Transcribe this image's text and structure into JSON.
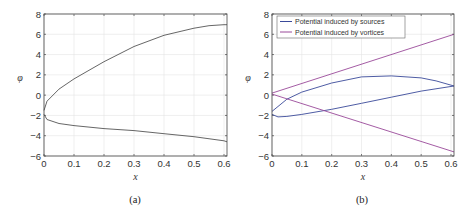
{
  "chart_data": [
    {
      "panel": "(a)",
      "type": "line",
      "xlabel": "x",
      "ylabel": "φ",
      "xlim": [
        0,
        0.61
      ],
      "ylim": [
        -6,
        8
      ],
      "xticks": [
        "0",
        "0.1",
        "0.2",
        "0.3",
        "0.4",
        "0.5",
        "0.6"
      ],
      "yticks": [
        "-6",
        "-4",
        "-2",
        "0",
        "2",
        "4",
        "6",
        "8"
      ],
      "grid": true,
      "series": [
        {
          "name": "upper",
          "x": [
            0,
            0.01,
            0.05,
            0.1,
            0.2,
            0.3,
            0.4,
            0.5,
            0.55,
            0.6,
            0.61
          ],
          "y": [
            -1.5,
            -0.6,
            0.6,
            1.6,
            3.3,
            4.8,
            5.9,
            6.6,
            6.85,
            6.95,
            6.95
          ]
        },
        {
          "name": "lower",
          "x": [
            0,
            0.01,
            0.05,
            0.1,
            0.2,
            0.3,
            0.4,
            0.5,
            0.6,
            0.61
          ],
          "y": [
            -1.9,
            -2.4,
            -2.8,
            -3.0,
            -3.3,
            -3.5,
            -3.8,
            -4.1,
            -4.5,
            -4.6
          ]
        }
      ]
    },
    {
      "panel": "(b)",
      "type": "line",
      "xlabel": "x",
      "ylabel": "φ",
      "xlim": [
        0,
        0.61
      ],
      "ylim": [
        -6,
        8
      ],
      "xticks": [
        "0",
        "0.1",
        "0.2",
        "0.3",
        "0.4",
        "0.5",
        "0.6"
      ],
      "yticks": [
        "-6",
        "-4",
        "-2",
        "0",
        "2",
        "4",
        "6",
        "8"
      ],
      "grid": true,
      "legend": [
        "Potential induced by sources",
        "Potential induced by vortices"
      ],
      "legend_position": "upper left",
      "series": [
        {
          "name": "Potential induced by sources (upper)",
          "x": [
            0,
            0.05,
            0.1,
            0.2,
            0.3,
            0.4,
            0.5,
            0.55,
            0.61
          ],
          "y": [
            -1.6,
            -0.4,
            0.3,
            1.2,
            1.8,
            1.9,
            1.7,
            1.4,
            0.9
          ]
        },
        {
          "name": "Potential induced by sources (lower)",
          "x": [
            0,
            0.02,
            0.05,
            0.1,
            0.2,
            0.3,
            0.4,
            0.5,
            0.61
          ],
          "y": [
            -1.9,
            -2.15,
            -2.1,
            -1.9,
            -1.4,
            -0.8,
            -0.2,
            0.4,
            0.9
          ]
        },
        {
          "name": "Potential induced by vortices (upper)",
          "x": [
            0,
            0.61
          ],
          "y": [
            0.2,
            6.0
          ]
        },
        {
          "name": "Potential induced by vortices (lower)",
          "x": [
            0,
            0.61
          ],
          "y": [
            0.1,
            -5.6
          ]
        }
      ]
    }
  ],
  "panels": {
    "a": {
      "caption": "(a)",
      "xlabel": "x",
      "ylabel": "φ"
    },
    "b": {
      "caption": "(b)",
      "xlabel": "x",
      "ylabel": "φ",
      "legend": {
        "item1": "Potential induced by sources",
        "item2": "Potential induced by vortices"
      }
    }
  },
  "colors": {
    "sources": "#3a4a9a",
    "vortices": "#9a4a9a",
    "single": "#555555",
    "grid": "#e4e4e4",
    "axis": "#444444"
  }
}
